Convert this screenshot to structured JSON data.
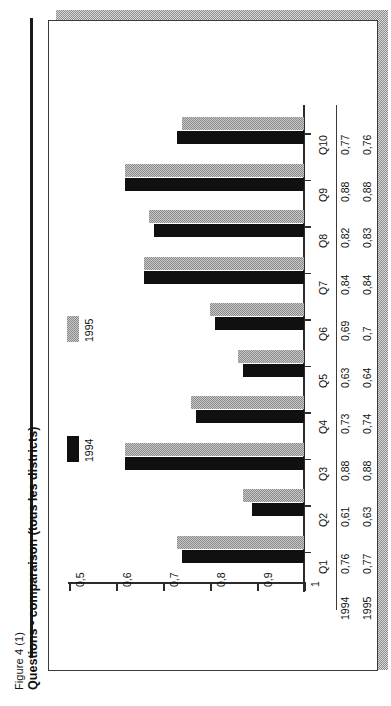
{
  "caption": {
    "figure_number": "Figure 4 (1)",
    "title": "Questions - comparaison (tous les districts)"
  },
  "legend": {
    "position": "left-inside",
    "items": [
      {
        "label": "1994",
        "color": "#101010"
      },
      {
        "label": "1995",
        "color": "#9a9a9a"
      }
    ]
  },
  "axis": {
    "ticks": [
      "1",
      "0,9",
      "0,8",
      "0,7",
      "0,6",
      "0,5"
    ],
    "values": [
      1,
      0.9,
      0.8,
      0.7,
      0.6,
      0.5
    ]
  },
  "table": {
    "row_headers": [
      "1994",
      "1995"
    ],
    "categories": [
      "Q1",
      "Q2",
      "Q3",
      "Q4",
      "Q5",
      "Q6",
      "Q7",
      "Q8",
      "Q9",
      "Q10"
    ],
    "rows": [
      [
        "0,76",
        "0,61",
        "0,88",
        "0,73",
        "0,63",
        "0,69",
        "0,84",
        "0,82",
        "0,88",
        "0,77"
      ],
      [
        "0,77",
        "0,63",
        "0,88",
        "0,74",
        "0,64",
        "0,7",
        "0,84",
        "0,83",
        "0,88",
        "0,76"
      ]
    ]
  },
  "chart_data": {
    "type": "bar",
    "orientation": "horizontal",
    "title": "Questions - comparaison (tous les districts)",
    "xlabel": "",
    "ylabel": "",
    "categories": [
      "Q1",
      "Q2",
      "Q3",
      "Q4",
      "Q5",
      "Q6",
      "Q7",
      "Q8",
      "Q9",
      "Q10"
    ],
    "series": [
      {
        "name": "1994",
        "color": "#101010",
        "values": [
          0.76,
          0.61,
          0.88,
          0.73,
          0.63,
          0.69,
          0.84,
          0.82,
          0.88,
          0.77
        ]
      },
      {
        "name": "1995",
        "color": "#9a9a9a",
        "values": [
          0.77,
          0.63,
          0.88,
          0.74,
          0.64,
          0.7,
          0.84,
          0.83,
          0.88,
          0.76
        ]
      }
    ],
    "xlim": [
      0.5,
      1.0
    ],
    "xticks": [
      0.5,
      0.6,
      0.7,
      0.8,
      0.9,
      1.0
    ],
    "grid": false,
    "legend_position": "inside-left",
    "data_table_shown": true
  }
}
